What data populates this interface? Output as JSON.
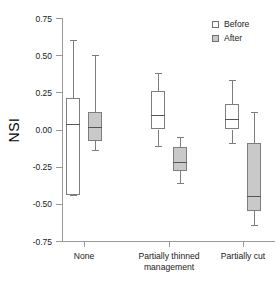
{
  "chart_data": {
    "type": "box",
    "title": "",
    "subtitle": "",
    "xlabel": "management",
    "ylabel": "NSI",
    "ylim": [
      -0.75,
      0.75
    ],
    "grid": false,
    "legend_position": "top-right",
    "categories": [
      "None",
      "Partially thinned",
      "Partially cut"
    ],
    "y_ticks": [
      "0.75",
      "0.50",
      "0.25",
      "0.00",
      "-0.25",
      "-0.50",
      "-0.75"
    ],
    "y_tick_values": [
      0.75,
      0.5,
      0.25,
      0.0,
      -0.25,
      -0.5,
      -0.75
    ],
    "legend": [
      {
        "label": "Before",
        "color": "#ffffff"
      },
      {
        "label": "After",
        "color": "#c9c9c9"
      }
    ],
    "series": [
      {
        "name": "Before",
        "color": "#ffffff",
        "boxes": [
          {
            "category": "None",
            "whisker_low": -0.44,
            "q1": -0.44,
            "median": 0.04,
            "q3": 0.21,
            "whisker_high": 0.6
          },
          {
            "category": "Partially thinned",
            "whisker_low": -0.11,
            "q1": 0.0,
            "median": 0.1,
            "q3": 0.26,
            "whisker_high": 0.38
          },
          {
            "category": "Partially cut",
            "whisker_low": -0.09,
            "q1": 0.0,
            "median": 0.07,
            "q3": 0.17,
            "whisker_high": 0.33
          }
        ]
      },
      {
        "name": "After",
        "color": "#c9c9c9",
        "boxes": [
          {
            "category": "None",
            "whisker_low": -0.14,
            "q1": -0.08,
            "median": 0.02,
            "q3": 0.12,
            "whisker_high": 0.5
          },
          {
            "category": "Partially thinned",
            "whisker_low": -0.36,
            "q1": -0.28,
            "median": -0.22,
            "q3": -0.12,
            "whisker_high": -0.05
          },
          {
            "category": "Partially cut",
            "whisker_low": -0.64,
            "q1": -0.55,
            "median": -0.45,
            "q3": -0.09,
            "whisker_high": 0.12
          }
        ]
      }
    ]
  },
  "axis": {
    "y_title": "NSI",
    "x_title": "management",
    "tick_labels_y": [
      "0.75",
      "0.50",
      "0.25",
      "0.00",
      "-0.25",
      "-0.50",
      "-0.75"
    ],
    "group_labels": [
      "None",
      "Partially thinned",
      "Partially cut"
    ]
  },
  "legend": {
    "before_label": "Before",
    "after_label": "After"
  }
}
